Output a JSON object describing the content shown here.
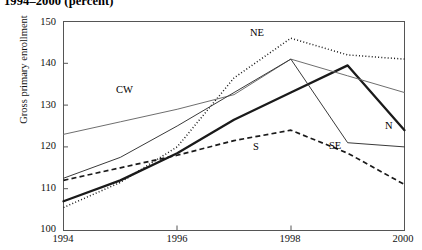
{
  "title": "1994–2000 (percent)",
  "axes": {
    "ylabel": "Gross primary enrollment",
    "xlabel": "",
    "yticks": [
      "100",
      "110",
      "120",
      "130",
      "140",
      "150"
    ],
    "xticks": [
      "1994",
      "1996",
      "1998",
      "2000"
    ]
  },
  "labels": {
    "n": "N",
    "ne": "NE",
    "cw": "CW",
    "se": "SE",
    "s": "S"
  },
  "chart_data": {
    "type": "line",
    "title": "1994–2000 (percent)",
    "xlabel": "",
    "ylabel": "Gross primary enrollment",
    "xlim": [
      1994,
      2000
    ],
    "ylim": [
      100,
      150
    ],
    "yticks": [
      100,
      110,
      120,
      130,
      140,
      150
    ],
    "xticks": [
      1994,
      1996,
      1998,
      2000
    ],
    "grid": false,
    "legend": "inline-annotations",
    "x": [
      1994,
      1995,
      1996,
      1997,
      1998,
      1999,
      2000
    ],
    "series": [
      {
        "name": "N",
        "style": "thick-solid-black",
        "color": "#1a1a1a",
        "values": [
          107.0,
          112.0,
          118.5,
          126.5,
          133.0,
          139.5,
          124.0
        ]
      },
      {
        "name": "NE",
        "style": "dotted-black",
        "color": "#1a1a1a",
        "values": [
          105.5,
          111.5,
          120.0,
          136.5,
          146.0,
          142.0,
          141.0
        ]
      },
      {
        "name": "CW",
        "style": "thin-solid-gray",
        "color": "#6e6e6e",
        "values": [
          123.0,
          126.0,
          129.0,
          132.5,
          141.0,
          137.0,
          133.0
        ]
      },
      {
        "name": "SE",
        "style": "thin-solid-black",
        "color": "#3a3a3a",
        "values": [
          112.5,
          117.5,
          125.0,
          133.0,
          141.0,
          121.0,
          120.0
        ]
      },
      {
        "name": "S",
        "style": "dashed-black",
        "color": "#1a1a1a",
        "values": [
          112.0,
          115.0,
          118.0,
          121.5,
          124.0,
          118.5,
          111.0
        ]
      }
    ],
    "annotations": [
      {
        "text": "NE",
        "x": 1997.0,
        "y": 148.0
      },
      {
        "text": "CW",
        "x": 1995.1,
        "y": 131.5
      },
      {
        "text": "SE",
        "x": 1999.0,
        "y": 125.0
      },
      {
        "text": "N",
        "x": 1999.5,
        "y": 130.0
      },
      {
        "text": "S",
        "x": 1997.2,
        "y": 120.5
      }
    ]
  }
}
